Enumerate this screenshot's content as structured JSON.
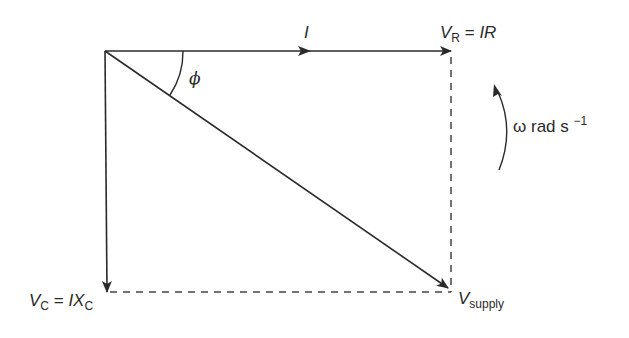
{
  "diagram": {
    "colors": {
      "stroke": "#2a2a2a",
      "dashed": "#444444",
      "background": "#ffffff"
    },
    "labels": {
      "current": {
        "symbol": "I"
      },
      "resistor_voltage": {
        "symbol": "V",
        "subscript": "R",
        "equals": " = ",
        "expr": "IR"
      },
      "capacitor_voltage": {
        "symbol": "V",
        "subscript": "C",
        "equals": " = ",
        "expr_main": "IX",
        "expr_sub": "C"
      },
      "supply_voltage": {
        "symbol": "V",
        "subscript": "supply"
      },
      "phase_angle": {
        "symbol": "ϕ"
      },
      "angular_velocity": {
        "omega": "ω",
        "unit": " rad s ",
        "exponent": "−1"
      }
    },
    "geometry": {
      "origin": [
        105,
        51
      ],
      "current_tip": [
        451,
        51
      ],
      "vr_tip": [
        451,
        51
      ],
      "vc_tip": [
        107,
        292
      ],
      "supply_tip": [
        449,
        289
      ],
      "phi_arc_radius": 78,
      "rotation_direction": "anticlockwise"
    }
  }
}
